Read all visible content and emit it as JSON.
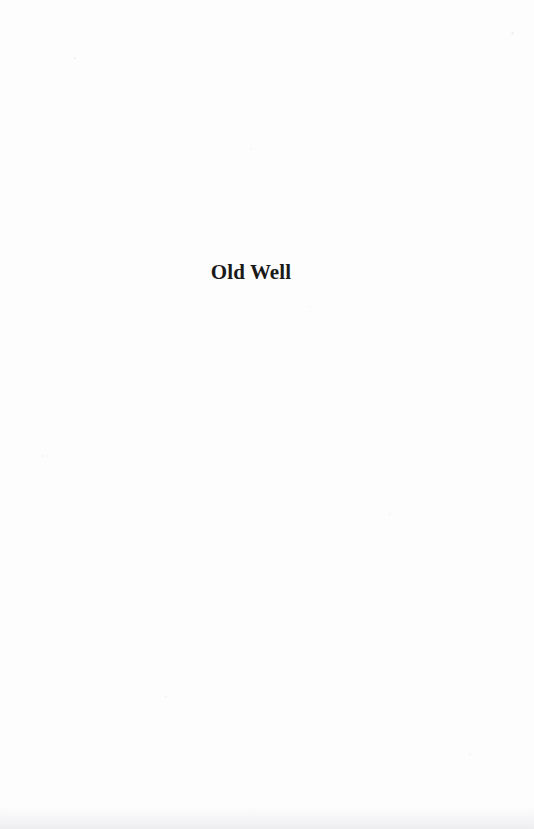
{
  "page": {
    "kind": "scanned-book-page",
    "width": 534,
    "height": 829,
    "background_color": "#fdfdfd",
    "ink_color": "#1a1a1a"
  },
  "content": {
    "section_title": "Old Well"
  }
}
